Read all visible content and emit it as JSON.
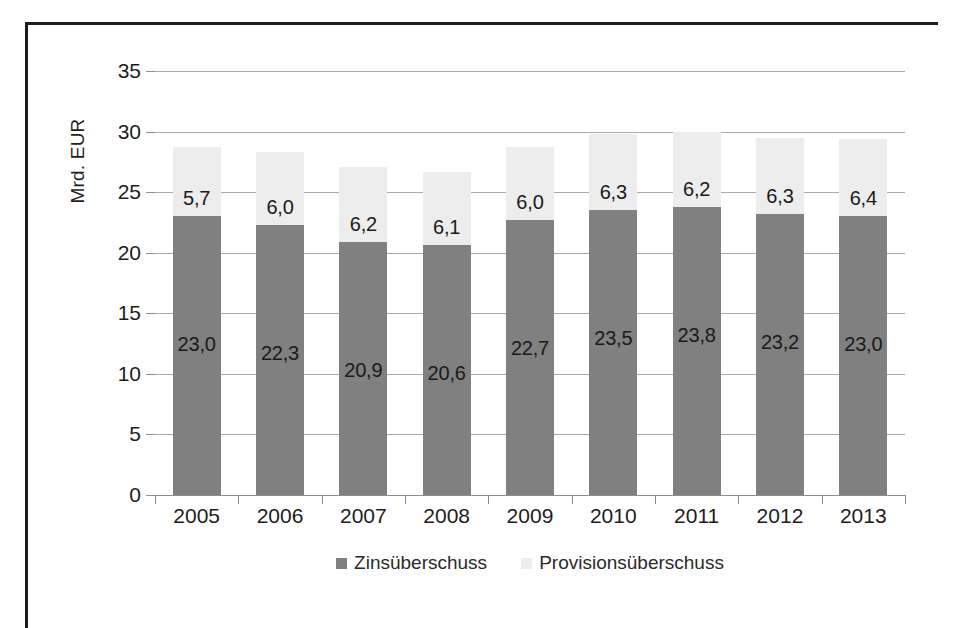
{
  "chart_data": {
    "type": "bar",
    "subtype": "stacked-column",
    "title": "",
    "xlabel": "",
    "ylabel": "Mrd. EUR",
    "ylim": [
      0,
      35
    ],
    "ytick_step": 5,
    "yticks": [
      "35",
      "30",
      "25",
      "20",
      "15",
      "10",
      "5",
      "0"
    ],
    "ytick_values": [
      35,
      30,
      25,
      20,
      15,
      10,
      5,
      0
    ],
    "grid": true,
    "grid_axis": "y",
    "legend_position": "bottom",
    "decimal_separator": ",",
    "categories": [
      "2005",
      "2006",
      "2007",
      "2008",
      "2009",
      "2010",
      "2011",
      "2012",
      "2013"
    ],
    "series": [
      {
        "name": "Zinsüberschuss",
        "color": "#808080",
        "values": [
          23.0,
          22.3,
          20.9,
          20.6,
          22.7,
          23.5,
          23.8,
          23.2,
          23.0
        ],
        "labels": [
          "23,0",
          "22,3",
          "20,9",
          "20,6",
          "22,7",
          "23,5",
          "23,8",
          "23,2",
          "23,0"
        ]
      },
      {
        "name": "Provisionsüberschuss",
        "color": "#ededed",
        "values": [
          5.7,
          6.0,
          6.2,
          6.1,
          6.0,
          6.3,
          6.2,
          6.3,
          6.4
        ],
        "labels": [
          "5,7",
          "6,0",
          "6,2",
          "6,1",
          "6,0",
          "6,3",
          "6,2",
          "6,3",
          "6,4"
        ]
      }
    ],
    "totals": [
      28.7,
      28.3,
      27.1,
      26.7,
      28.7,
      29.8,
      30.0,
      29.5,
      29.4
    ]
  },
  "legend": {
    "items": [
      {
        "label": "Zinsüberschuss",
        "color": "#808080"
      },
      {
        "label": "Provisionsüberschuss",
        "color": "#ededed"
      }
    ]
  },
  "axis": {
    "y_title": "Mrd. EUR"
  }
}
